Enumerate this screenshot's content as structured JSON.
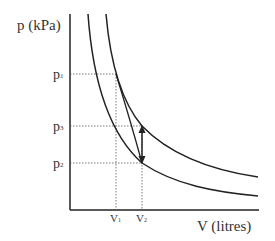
{
  "diagram": {
    "y_axis_label": "p (kPa)",
    "x_axis_label": "V (litres)",
    "y_ticks": [
      {
        "label": "p",
        "sub": "1",
        "y": 74
      },
      {
        "label": "p",
        "sub": "3",
        "y": 126
      },
      {
        "label": "p",
        "sub": "2",
        "y": 163
      }
    ],
    "x_ticks": [
      {
        "label": "V",
        "sub": "1",
        "x": 116
      },
      {
        "label": "V",
        "sub": "2",
        "x": 142
      }
    ],
    "curves": [
      "lower-isotherm",
      "upper-isotherm"
    ],
    "process_lines": [
      "adiabatic expansion p1→p2",
      "isochoric p2↔p3 (double arrow)"
    ]
  }
}
